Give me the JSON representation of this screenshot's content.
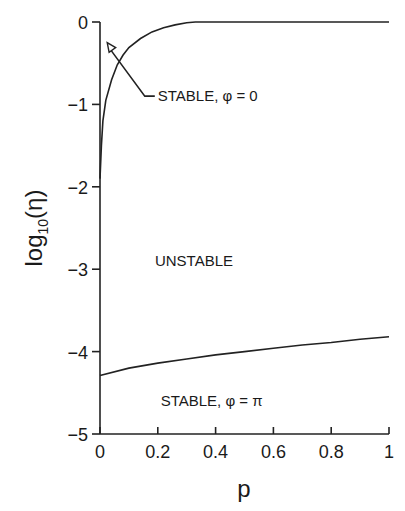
{
  "chart_data": {
    "type": "line",
    "title": "",
    "xlabel": "p",
    "ylabel": "log10(η)",
    "ylabel_parts": {
      "base": "log",
      "sub": "10",
      "arg": "(η)"
    },
    "xlim": [
      0,
      1
    ],
    "ylim": [
      -5,
      0
    ],
    "grid": false,
    "x_ticks": [
      "0",
      "0.2",
      "0.4",
      "0.6",
      "0.8",
      "1"
    ],
    "x_tick_values": [
      0,
      0.2,
      0.4,
      0.6,
      0.8,
      1
    ],
    "y_ticks": [
      "0",
      "−1",
      "−2",
      "−3",
      "−4",
      "−5"
    ],
    "y_tick_values": [
      0,
      -1,
      -2,
      -3,
      -4,
      -5
    ],
    "series": [
      {
        "name": "upper boundary (φ = 0)",
        "x": [
          0.0,
          0.005,
          0.01,
          0.02,
          0.04,
          0.06,
          0.08,
          0.1,
          0.14,
          0.18,
          0.22,
          0.26,
          0.3,
          0.33,
          1.0
        ],
        "y": [
          -1.9,
          -1.5,
          -1.2,
          -0.95,
          -0.7,
          -0.52,
          -0.4,
          -0.31,
          -0.2,
          -0.12,
          -0.07,
          -0.035,
          -0.01,
          0.0,
          0.0
        ]
      },
      {
        "name": "lower boundary (φ = π)",
        "x": [
          0.0,
          0.1,
          0.2,
          0.3,
          0.4,
          0.5,
          0.6,
          0.7,
          0.8,
          0.9,
          1.0
        ],
        "y": [
          -4.29,
          -4.2,
          -4.14,
          -4.09,
          -4.04,
          -4.0,
          -3.96,
          -3.92,
          -3.89,
          -3.85,
          -3.82
        ]
      }
    ],
    "annotations": [
      {
        "text": "STABLE, φ = 0",
        "x": 0.2,
        "y": -0.9,
        "arrow_to": {
          "x": 0.025,
          "y": -0.25
        }
      },
      {
        "text": "UNSTABLE",
        "x": 0.19,
        "y": -2.9
      },
      {
        "text": "STABLE, φ = π",
        "x": 0.21,
        "y": -4.6
      }
    ]
  }
}
